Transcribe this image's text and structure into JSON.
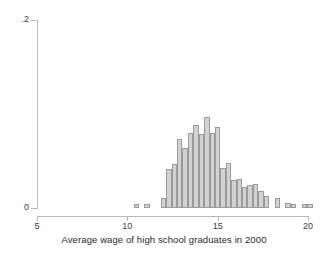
{
  "chart_data": {
    "type": "bar",
    "title": "",
    "subtitle": "",
    "xlabel": "Average wage of high school graduates in 2000",
    "ylabel": "",
    "xlim": [
      5,
      20.7
    ],
    "ylim": [
      0,
      0.2
    ],
    "xticks": [
      5,
      10,
      15,
      20
    ],
    "xtick_labels": [
      "5",
      "10",
      "15",
      "20"
    ],
    "yticks": [
      0,
      0.2
    ],
    "ytick_labels": [
      "0",
      ".2"
    ],
    "grid": false,
    "legend": false,
    "bar_width": 0.3,
    "bar_fill_color": "#d2d2d2",
    "bar_edge_color": "#9a9a9a",
    "axis_color": "#b9b9b9",
    "categories": [
      10.5,
      10.8,
      11.1,
      11.4,
      11.7,
      12.0,
      12.3,
      12.6,
      12.9,
      13.2,
      13.5,
      13.8,
      14.1,
      14.4,
      14.7,
      15.0,
      15.3,
      15.6,
      15.9,
      16.2,
      16.5,
      16.8,
      17.1,
      17.4,
      17.7,
      18.0,
      18.3,
      18.6,
      18.9,
      19.2,
      19.5,
      19.8,
      20.1
    ],
    "values": [
      0.004,
      0.0,
      0.004,
      0.0,
      0.0,
      0.011,
      0.042,
      0.047,
      0.073,
      0.064,
      0.08,
      0.088,
      0.079,
      0.097,
      0.08,
      0.086,
      0.043,
      0.048,
      0.03,
      0.031,
      0.022,
      0.024,
      0.026,
      0.018,
      0.013,
      0.0,
      0.011,
      0.0,
      0.005,
      0.004,
      0.0,
      0.004,
      0.004
    ],
    "series": [
      {
        "name": "density",
        "values": [
          0.004,
          0.0,
          0.004,
          0.0,
          0.0,
          0.011,
          0.042,
          0.047,
          0.073,
          0.064,
          0.08,
          0.088,
          0.079,
          0.097,
          0.08,
          0.086,
          0.043,
          0.048,
          0.03,
          0.031,
          0.022,
          0.024,
          0.026,
          0.018,
          0.013,
          0.0,
          0.011,
          0.0,
          0.005,
          0.004,
          0.0,
          0.004,
          0.004
        ]
      }
    ]
  }
}
